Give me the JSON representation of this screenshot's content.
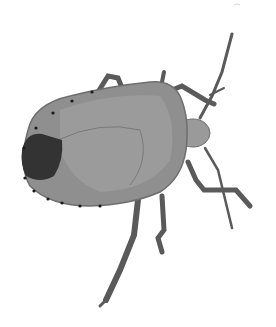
{
  "image": {
    "subject": "shield bug (stink bug), top-down view",
    "style": "grayscale photograph on white background",
    "colors": {
      "background": "#ffffff",
      "body": "#8f8f8f",
      "body_light": "#a6a6a6",
      "body_dark": "#6e6e6e",
      "tip_dark": "#333333",
      "leg": "#5a5a5a",
      "edge_dots": "#1a1a1a"
    }
  }
}
